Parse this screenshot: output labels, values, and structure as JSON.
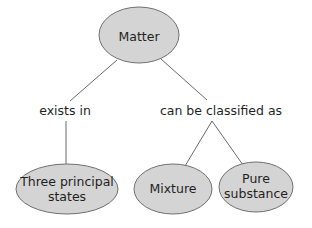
{
  "diagram": {
    "type": "concept-map",
    "colors": {
      "node_fill": "#d4d4d4",
      "node_stroke": "#6f6f6f",
      "edge": "#6a6a6a",
      "text": "#1f1f1f",
      "background": "#ffffff"
    },
    "nodes": [
      {
        "id": "matter",
        "lines": [
          "Matter"
        ]
      },
      {
        "id": "three-principal-states",
        "lines": [
          "Three principal",
          "states"
        ]
      },
      {
        "id": "mixture",
        "lines": [
          "Mixture"
        ]
      },
      {
        "id": "pure-substance",
        "lines": [
          "Pure",
          "substance"
        ]
      }
    ],
    "links": [
      {
        "from": "matter",
        "to": "three-principal-states",
        "label": "exists in"
      },
      {
        "from": "matter",
        "to": "mixture",
        "label": "can be classified as"
      },
      {
        "from": "matter",
        "to": "pure-substance",
        "label": "can be classified as"
      }
    ],
    "labels": {
      "exists_in": "exists in",
      "can_be_classified_as": "can be classified as"
    }
  }
}
